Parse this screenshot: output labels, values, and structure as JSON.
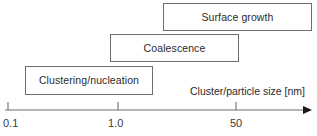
{
  "figure": {
    "type": "diagram",
    "background_color": "#ffffff",
    "line_color": "#6e6e6e",
    "text_color": "#2b2b2b"
  },
  "stages": [
    {
      "id": "surface-growth",
      "label": "Surface growth",
      "size_range_nm": [
        10,
        100
      ]
    },
    {
      "id": "coalescence",
      "label": "Coalescence",
      "size_range_nm": [
        0.8,
        20
      ]
    },
    {
      "id": "clustering-nucleation",
      "label": "Clustering/nucleation",
      "size_range_nm": [
        0.13,
        3
      ]
    }
  ],
  "axis": {
    "label": "Cluster/particle size [nm]",
    "scale": "log",
    "arrow": "right-arrow-icon",
    "ticks": [
      {
        "label": "0.1",
        "value": 0.1,
        "x": 8
      },
      {
        "label": "1.0",
        "value": 1.0,
        "x": 118
      },
      {
        "label": "50",
        "value": 50,
        "x": 236
      }
    ]
  }
}
